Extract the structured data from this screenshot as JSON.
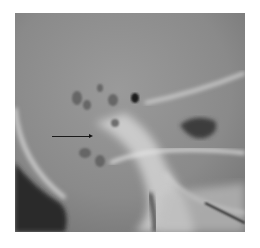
{
  "image": {
    "subject": "lateral skull radiograph",
    "annotation": {
      "type": "arrow",
      "direction": "right",
      "color": "#1a1a1a"
    },
    "colors": {
      "background": "#ffffff",
      "film_base": "#8c8c8c",
      "bone_bright": "#e6e6e6",
      "dark_air": "#2a2a2a"
    }
  }
}
